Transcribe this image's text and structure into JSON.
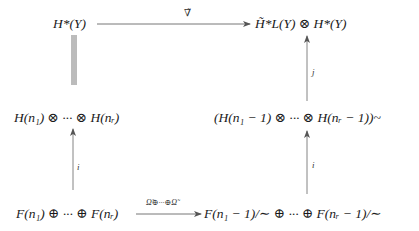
{
  "diagram": {
    "type": "commutative-diagram",
    "nodes": {
      "top_left": "H*(Y)",
      "top_right": "H̃*L(Y) ⊗ H*(Y)",
      "mid_left": "H(n₁) ⊗ ··· ⊗ H(nᵣ)",
      "mid_right": "(H(n₁ − 1) ⊗ ··· ⊗ H(nᵣ − 1))~",
      "bottom_left": "F(n₁) ⊕ ··· ⊕ F(nᵣ)",
      "bottom_right": "F(n₁ − 1)/∼ ⊕ ··· ⊕ F(nᵣ − 1)/∼"
    },
    "edges": [
      {
        "from": "top_left",
        "to": "top_right",
        "label": "∇̃",
        "style": "arrow"
      },
      {
        "from": "top_left",
        "to": "mid_left",
        "label": "",
        "style": "triple-line"
      },
      {
        "from": "bottom_left",
        "to": "mid_left",
        "label": "i",
        "style": "arrow"
      },
      {
        "from": "bottom_left",
        "to": "bottom_right",
        "label": "Ω̃⊕···⊕Ω̃",
        "style": "arrow"
      },
      {
        "from": "bottom_right",
        "to": "mid_right",
        "label": "i",
        "style": "arrow"
      },
      {
        "from": "mid_right",
        "to": "top_right",
        "label": "j",
        "style": "arrow"
      }
    ],
    "labels": {
      "top_arrow": "∇̃",
      "left_lower_arrow": "i",
      "bottom_arrow": "Ω̃⊕···⊕Ω̃",
      "right_lower_arrow": "i",
      "right_upper_arrow": "j"
    }
  }
}
